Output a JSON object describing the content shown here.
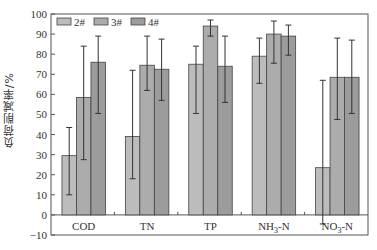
{
  "chart_data": {
    "type": "bar",
    "title": "",
    "xlabel": "",
    "ylabel": "负荷削减率/%",
    "ylim": [
      -10,
      100
    ],
    "yticks": [
      -10,
      0,
      10,
      20,
      30,
      40,
      50,
      60,
      70,
      80,
      90,
      100
    ],
    "grid": false,
    "legend_position": "top-left",
    "categories": [
      "COD",
      "TN",
      "TP",
      "NH3-N",
      "NO3-N"
    ],
    "category_labels": [
      {
        "main": "COD",
        "sub": "",
        "suffix": ""
      },
      {
        "main": "TN",
        "sub": "",
        "suffix": ""
      },
      {
        "main": "TP",
        "sub": "",
        "suffix": ""
      },
      {
        "main": "NH",
        "sub": "3",
        "suffix": "-N"
      },
      {
        "main": "NO",
        "sub": "3",
        "suffix": "-N"
      }
    ],
    "series": [
      {
        "name": "2#",
        "color": "#bcbcbc",
        "values": [
          29.5,
          39,
          75,
          79,
          23.5
        ],
        "err_low": [
          10,
          18,
          50.5,
          65.5,
          -4.5
        ],
        "err_high": [
          43.5,
          72,
          84,
          88,
          67
        ]
      },
      {
        "name": "3#",
        "color": "#acacac",
        "values": [
          58.5,
          74.5,
          94,
          90,
          68.5
        ],
        "err_low": [
          27.5,
          62,
          89,
          75.5,
          47.5
        ],
        "err_high": [
          84,
          89,
          97,
          96.5,
          88
        ]
      },
      {
        "name": "4#",
        "color": "#9c9c9c",
        "values": [
          76,
          72.5,
          74,
          89,
          68.5
        ],
        "err_low": [
          50.5,
          57,
          56,
          79.5,
          50.5
        ],
        "err_high": [
          89,
          87.5,
          89,
          94.5,
          87
        ]
      }
    ]
  }
}
